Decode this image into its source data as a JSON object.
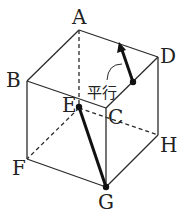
{
  "diagram": {
    "type": "cube",
    "vertices": {
      "A": {
        "label": "A",
        "x": 79,
        "y": 30
      },
      "B": {
        "label": "B",
        "x": 27,
        "y": 81
      },
      "C": {
        "label": "C",
        "x": 106,
        "y": 108
      },
      "D": {
        "label": "D",
        "x": 158,
        "y": 57
      },
      "E": {
        "label": "E",
        "x": 79,
        "y": 108
      },
      "F": {
        "label": "F",
        "x": 27,
        "y": 159
      },
      "G": {
        "label": "G",
        "x": 106,
        "y": 187
      },
      "H": {
        "label": "H",
        "x": 158,
        "y": 135
      }
    },
    "annotation": {
      "text": "平行"
    },
    "segments": [
      {
        "name": "EG",
        "style": "bold"
      },
      {
        "name": "vector-parallel-to-EG",
        "style": "bold-arrow"
      }
    ],
    "colors": {
      "line": "#2a2a2a",
      "bold": "#111111"
    }
  }
}
